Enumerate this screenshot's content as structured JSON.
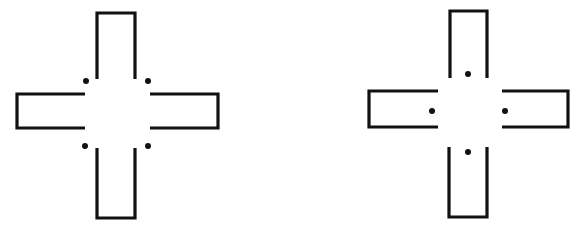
{
  "diagram": {
    "background": "#ffffff",
    "stroke_color": "#111111",
    "figures": [
      {
        "name": "left-cross",
        "dot_placement": "corners",
        "arms": {
          "top": "M97,79 L97,13 L135,13 L135,79",
          "left": "M85,94 L17,94 L17,128 L85,128",
          "right": "M150,94 L218,94 L218,128 L150,128",
          "bottom": "M97,148 L97,218 L135,218 L135,148"
        },
        "dots": [
          [
            86,
            81
          ],
          [
            148,
            81
          ],
          [
            85,
            146
          ],
          [
            148,
            146
          ]
        ]
      },
      {
        "name": "right-cross",
        "dot_placement": "arm-openings",
        "arms": {
          "top": "M450,78 L450,11 L487,11 L487,78",
          "left": "M438,91 L369,91 L369,127 L438,127",
          "right": "M502,91 L568,91 L568,127 L502,127",
          "bottom": "M449,147 L449,217 L487,217 L487,147"
        },
        "dots": [
          [
            468,
            74
          ],
          [
            432,
            111
          ],
          [
            505,
            111
          ],
          [
            468,
            152
          ]
        ]
      }
    ]
  }
}
